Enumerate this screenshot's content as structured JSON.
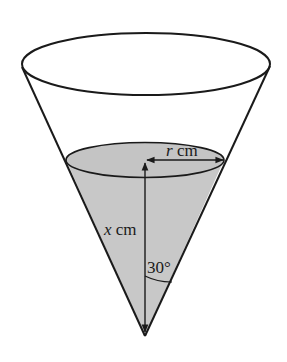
{
  "figure": {
    "labels": {
      "radius_var": "r",
      "radius_unit": " cm",
      "height_var": "x",
      "height_unit": " cm",
      "angle": "30°"
    },
    "colors": {
      "stroke": "#1a1a1a",
      "water_fill": "#c8c8c8",
      "background": "#ffffff"
    }
  }
}
